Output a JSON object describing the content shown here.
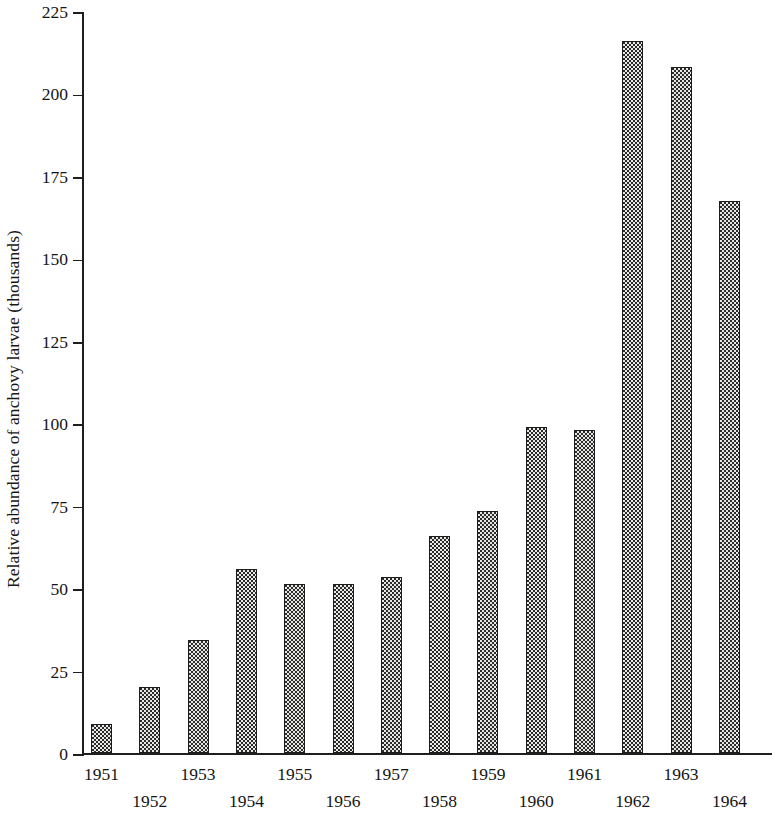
{
  "chart_data": {
    "type": "bar",
    "title": "",
    "xlabel": "",
    "ylabel": "Relative abundance of anchovy larvae (thousands)",
    "categories": [
      "1951",
      "1952",
      "1953",
      "1954",
      "1955",
      "1956",
      "1957",
      "1958",
      "1959",
      "1960",
      "1961",
      "1962",
      "1963",
      "1964"
    ],
    "values": [
      9,
      20,
      34.5,
      56,
      51.5,
      51.5,
      53.5,
      66,
      73.5,
      99,
      98,
      216,
      208,
      167.5
    ],
    "ylim": [
      0,
      225
    ],
    "xlim_note": "categorical, 14 years 1951-1964",
    "y_ticks": [
      0,
      25,
      50,
      75,
      100,
      125,
      150,
      175,
      200,
      225
    ],
    "y_tick_labels": [
      "0",
      "25",
      "50",
      "75",
      "100",
      "125",
      "150",
      "175",
      "200",
      "225"
    ],
    "grid": false,
    "legend": null,
    "legend_position": "none",
    "bar_fill": "#e9e9e6",
    "bar_pattern": "fine dotted halftone",
    "bar_edge_color": "#1c1c1c",
    "axis_color": "#1f1f1f",
    "x_label_layout": "alternating two rows: odd years upper row, even years lower row"
  }
}
